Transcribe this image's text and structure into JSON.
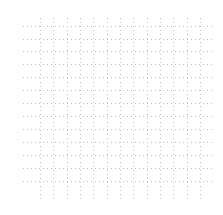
{
  "chart_data": {
    "type": "scatter",
    "title": "",
    "xlabel": "",
    "ylabel": "",
    "series": [],
    "grid": true,
    "grid_style": "dotted",
    "grid_color": "#bdbdbd",
    "legend": null,
    "layout": {
      "vertical_lines_x": [
        40,
        53,
        67,
        80,
        93,
        107,
        120,
        133,
        147,
        160,
        173,
        187,
        200
      ],
      "vertical_y_range": [
        18,
        200
      ],
      "horizontal_lines_y": [
        26,
        39,
        51,
        64,
        77,
        90,
        103,
        116,
        129,
        142,
        155,
        168,
        181
      ],
      "horizontal_x_range": [
        23,
        215
      ]
    }
  }
}
